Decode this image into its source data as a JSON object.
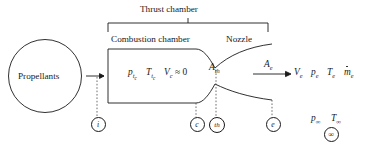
{
  "figure": {
    "title_bracket_label": "Thrust chamber",
    "section_left_label": "Combustion chamber",
    "section_right_label": "Nozzle",
    "source_label": "Propellants",
    "colors": {
      "line": "#1a1a1a",
      "dashed": "#4a4a4a",
      "background": "#ffffff"
    }
  },
  "chamber_state": {
    "pressure_symbol": "p",
    "pressure_subscript": "t",
    "pressure_subscript2": "c",
    "temperature_symbol": "T",
    "temperature_subscript": "t",
    "temperature_subscript2": "c",
    "velocity_symbol": "V",
    "velocity_subscript": "c",
    "velocity_relation": "≈ 0"
  },
  "areas": {
    "throat_symbol": "A",
    "throat_subscript": "th",
    "exit_symbol": "A",
    "exit_subscript": "e"
  },
  "exit_state": {
    "velocity_symbol": "V",
    "velocity_subscript": "e",
    "pressure_symbol": "p",
    "pressure_subscript": "e",
    "temperature_symbol": "T",
    "temperature_subscript": "e",
    "massflow_symbol": "m",
    "massflow_subscript": "e"
  },
  "ambient_state": {
    "pressure_symbol": "p",
    "pressure_subscript": "∞",
    "temperature_symbol": "T",
    "temperature_subscript": "∞"
  },
  "stations": [
    {
      "id": "inlet",
      "label": "i",
      "x": 97
    },
    {
      "id": "chamber-end",
      "label": "c",
      "x": 196
    },
    {
      "id": "throat",
      "label": "th",
      "x": 216
    },
    {
      "id": "exit",
      "label": "e",
      "x": 272
    },
    {
      "id": "ambient",
      "label": "∞",
      "x": 330
    }
  ]
}
